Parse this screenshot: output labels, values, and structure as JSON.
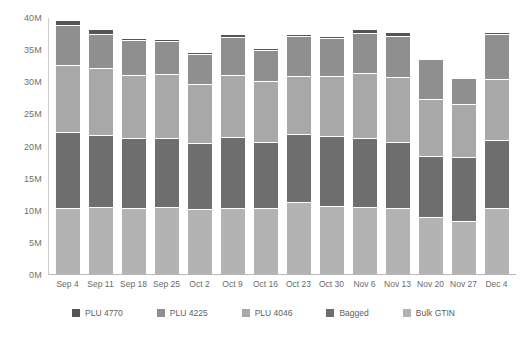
{
  "chart_data": {
    "type": "bar",
    "stacked": true,
    "title": "",
    "xlabel": "",
    "ylabel": "",
    "ylim": [
      0,
      40
    ],
    "yunit": "M",
    "ytick_labels": [
      "40M",
      "35M",
      "30M",
      "25M",
      "20M",
      "15M",
      "10M",
      "5M",
      "0M"
    ],
    "ytick_values": [
      40,
      35,
      30,
      25,
      20,
      15,
      10,
      5,
      0
    ],
    "grid": false,
    "legend_position": "bottom",
    "categories": [
      "Sep 4",
      "Sep 11",
      "Sep 18",
      "Sep 25",
      "Oct 2",
      "Oct 9",
      "Oct 16",
      "Oct 23",
      "Oct 30",
      "Nov 6",
      "Nov 13",
      "Nov 20",
      "Nov 27",
      "Dec 4"
    ],
    "series": [
      {
        "name": "Bulk GTIN",
        "color": "#b3b3b3",
        "values": [
          10.2,
          10.4,
          10.3,
          10.5,
          10.1,
          10.3,
          10.2,
          11.2,
          10.6,
          10.4,
          10.3,
          8.9,
          8.2,
          10.2
        ]
      },
      {
        "name": "Bagged",
        "color": "#6e6e6e",
        "values": [
          11.9,
          11.2,
          10.9,
          10.7,
          10.3,
          11.0,
          10.4,
          10.6,
          10.9,
          10.7,
          10.2,
          9.5,
          10.0,
          10.6
        ]
      },
      {
        "name": "PLU 4046",
        "color": "#a8a8a8",
        "values": [
          10.5,
          10.4,
          9.8,
          9.9,
          9.1,
          9.6,
          9.5,
          9.0,
          9.3,
          10.2,
          10.1,
          8.9,
          8.3,
          9.6
        ]
      },
      {
        "name": "PLU 4225",
        "color": "#8f8f8f",
        "values": [
          6.1,
          5.4,
          5.4,
          5.1,
          4.8,
          6.0,
          4.8,
          6.2,
          5.9,
          6.2,
          6.5,
          6.1,
          4.0,
          7.0
        ]
      },
      {
        "name": "PLU 4770",
        "color": "#555555",
        "values": [
          0.9,
          0.7,
          0.4,
          0.4,
          0.3,
          0.5,
          0.3,
          0.4,
          0.4,
          0.6,
          0.5,
          0.2,
          0.1,
          0.2
        ]
      }
    ],
    "totals": [
      39.6,
      38.1,
      36.8,
      36.6,
      34.6,
      37.4,
      35.2,
      37.4,
      37.1,
      38.1,
      37.6,
      33.6,
      30.6,
      37.6
    ]
  },
  "legend": {
    "items": [
      {
        "label": "PLU 4770",
        "color": "#555555"
      },
      {
        "label": "PLU 4225",
        "color": "#8f8f8f"
      },
      {
        "label": "PLU 4046",
        "color": "#a8a8a8"
      },
      {
        "label": "Bagged",
        "color": "#6e6e6e"
      },
      {
        "label": "Bulk GTIN",
        "color": "#b3b3b3"
      }
    ]
  }
}
